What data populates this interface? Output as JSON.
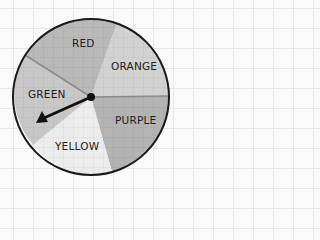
{
  "spinner": {
    "center": [
      91,
      97
    ],
    "radius": 78,
    "sections": [
      {
        "label": "RED",
        "color": "#b9b9b9"
      },
      {
        "label": "ORANGE",
        "color": "#d2d2d2"
      },
      {
        "label": "PURPLE",
        "color": "#b4b4b4"
      },
      {
        "label": "YELLOW",
        "color": "#ececec"
      },
      {
        "label": "GREEN",
        "color": "#c8c8c8"
      }
    ],
    "pointer": {
      "points_to": "GREEN"
    }
  }
}
